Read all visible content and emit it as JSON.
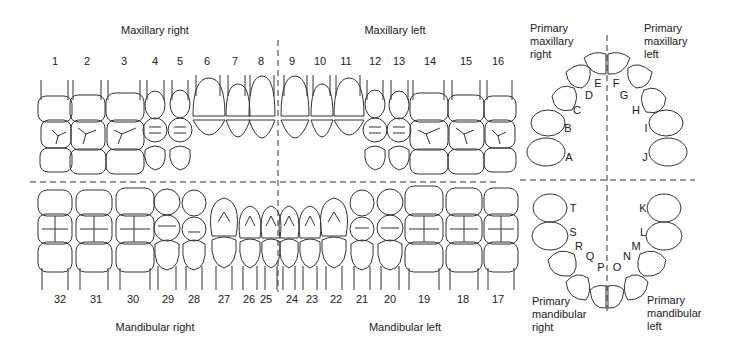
{
  "quadrants": {
    "maxillary_right": "Maxillary right",
    "maxillary_left": "Maxillary left",
    "mandibular_right": "Mandibular right",
    "mandibular_left": "Mandibular left"
  },
  "primary_labels": {
    "maxillary_right": "Primary\nmaxillary\nright",
    "maxillary_left": "Primary\nmaxillary\nleft",
    "mandibular_right": "Primary\nmandibular\nright",
    "mandibular_left": "Primary\nmandibular\nleft"
  },
  "upper_numbers": [
    "1",
    "2",
    "3",
    "4",
    "5",
    "6",
    "7",
    "8",
    "9",
    "10",
    "11",
    "12",
    "13",
    "14",
    "15",
    "16"
  ],
  "lower_numbers": [
    "32",
    "31",
    "30",
    "29",
    "28",
    "27",
    "26",
    "25",
    "24",
    "23",
    "22",
    "21",
    "20",
    "19",
    "18",
    "17"
  ],
  "primary_upper_letters": [
    "A",
    "B",
    "C",
    "D",
    "E",
    "F",
    "G",
    "H",
    "I",
    "J"
  ],
  "primary_lower_letters": [
    "K",
    "L",
    "M",
    "N",
    "O",
    "P",
    "Q",
    "R",
    "S",
    "T"
  ]
}
